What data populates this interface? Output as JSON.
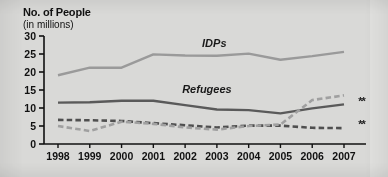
{
  "title": "No. of People",
  "subtitle": "(in millions)",
  "footnote_marker": "**",
  "series_labels": {
    "idps": "IDPs",
    "refugees": "Refugees"
  },
  "colors": {
    "idps_line": "#9a9a9a",
    "refugees_line": "#5a5a5a",
    "dashed_dark": "#4f4f4f",
    "dashed_light": "#a0a0a0",
    "axis": "#111111",
    "background": "#d9d9d7"
  },
  "chart_data": {
    "type": "line",
    "title": "No. of People",
    "subtitle": "(in millions)",
    "xlabel": "",
    "ylabel": "No. of People (in millions)",
    "categories": [
      "1998",
      "1999",
      "2000",
      "2001",
      "2002",
      "2003",
      "2004",
      "2005",
      "2006",
      "2007"
    ],
    "x": [
      1998,
      1999,
      2000,
      2001,
      2002,
      2003,
      2004,
      2005,
      2006,
      2007
    ],
    "ylim": [
      0,
      30
    ],
    "yticks": [
      0,
      5,
      10,
      15,
      20,
      25,
      30
    ],
    "grid": false,
    "legend": "inline-annotations",
    "annotations": [
      {
        "text": "IDPs",
        "x": 2003.1,
        "y": 27.4
      },
      {
        "text": "Refugees",
        "x": 2002.6,
        "y": 14.6
      },
      {
        "text": "**",
        "x": 2007.45,
        "y": 11.0
      },
      {
        "text": "**",
        "x": 2007.45,
        "y": 4.6
      }
    ],
    "series": [
      {
        "name": "IDPs",
        "style": "solid",
        "color": "#9a9a9a",
        "values": [
          19.1,
          21.2,
          21.2,
          24.9,
          24.6,
          24.5,
          25.1,
          23.4,
          24.4,
          25.6
        ]
      },
      {
        "name": "Refugees",
        "style": "solid",
        "color": "#5a5a5a",
        "values": [
          11.5,
          11.6,
          12.0,
          12.0,
          10.8,
          9.6,
          9.4,
          8.5,
          9.9,
          11.0
        ]
      },
      {
        "name": "Series 3 (dashed, dark)",
        "style": "dashed",
        "color": "#4f4f4f",
        "values": [
          6.7,
          6.6,
          6.4,
          5.8,
          5.2,
          4.6,
          5.1,
          5.1,
          4.5,
          4.4
        ]
      },
      {
        "name": "Series 4 (dashed, light)",
        "style": "dashed",
        "color": "#a0a0a0",
        "values": [
          5.0,
          3.6,
          6.2,
          5.6,
          4.6,
          4.0,
          5.0,
          5.4,
          12.2,
          13.5
        ]
      }
    ]
  }
}
